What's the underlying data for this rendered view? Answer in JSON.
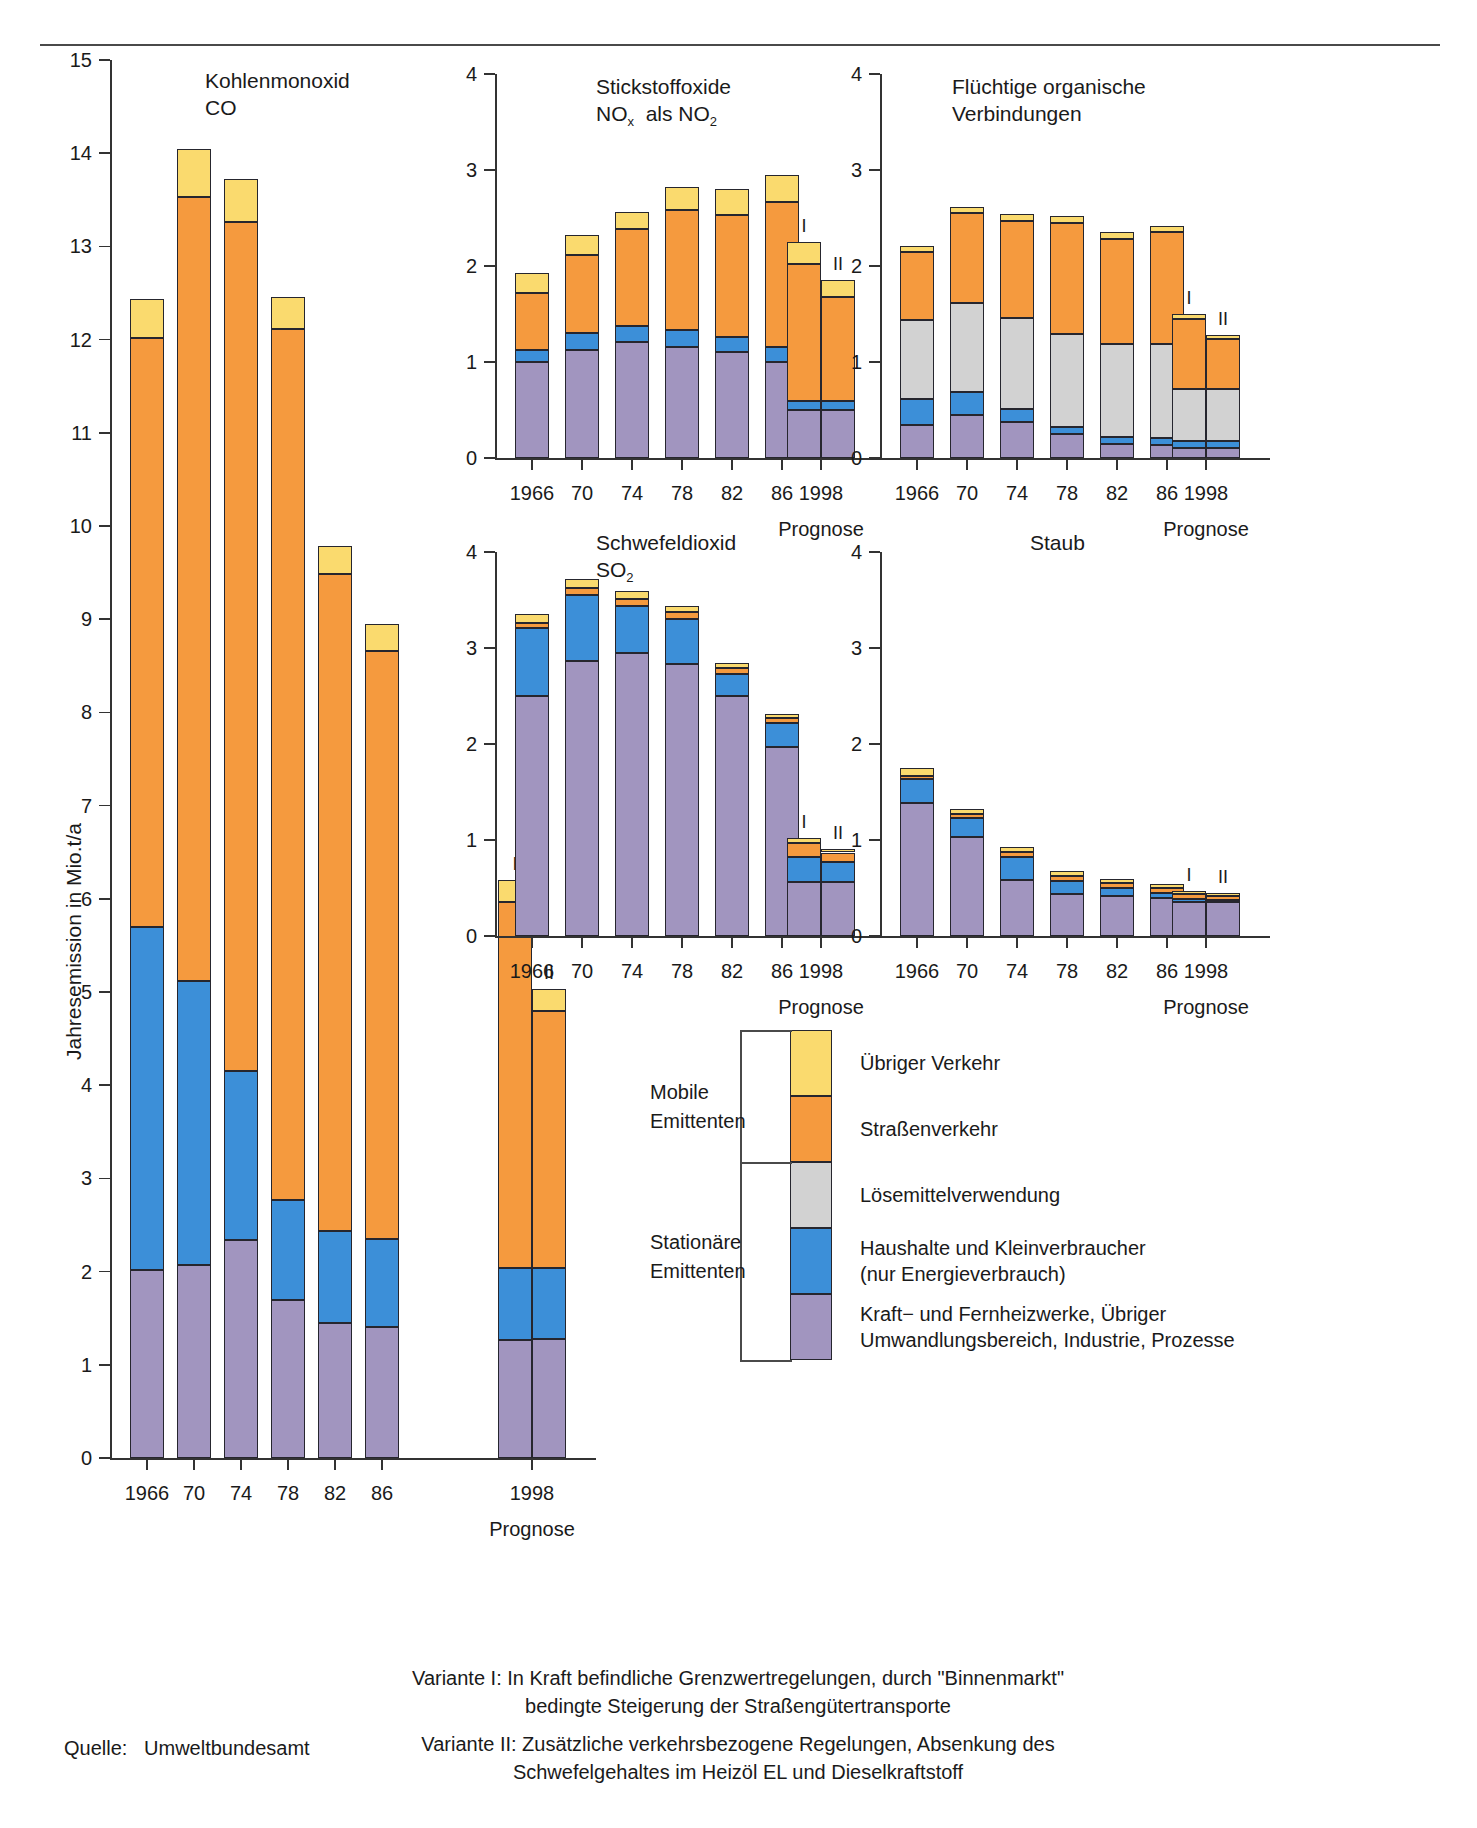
{
  "meta": {
    "y_axis_label": "Jahresemission in Mio.t/a",
    "source_label": "Quelle:",
    "source_value": "Umweltbundesamt",
    "prognose_label": "Prognose",
    "variant_i": "I",
    "variant_ii": "II"
  },
  "legend": {
    "group_mobile": "Mobile\nEmittenten",
    "group_mobile_l1": "Mobile",
    "group_mobile_l2": "Emittenten",
    "group_stationary_l1": "Stationäre",
    "group_stationary_l2": "Emittenten",
    "items": [
      {
        "key": "uebriger_verkehr",
        "label": "Übriger Verkehr",
        "color": "#fada6e"
      },
      {
        "key": "strassenverkehr",
        "label": "Straßenverkehr",
        "color": "#f59a3e"
      },
      {
        "key": "loesemittel",
        "label": "Lösemittelverwendung",
        "color": "#d2d2d2"
      },
      {
        "key": "haushalte",
        "label": "Haushalte und Kleinverbraucher",
        "label2": "(nur Energieverbrauch)",
        "color": "#3c8fd8"
      },
      {
        "key": "kraftwerke",
        "label": "Kraft− und Fernheizwerke, Übriger",
        "label2": "Umwandlungsbereich, Industrie, Prozesse",
        "color": "#a195bf"
      }
    ]
  },
  "footnotes": [
    {
      "line1": "Variante I: In Kraft befindliche Grenzwertregelungen, durch \"Binnenmarkt\"",
      "line2": "bedingte Steigerung der Straßengütertransporte"
    },
    {
      "line1": "Variante II: Zusätzliche verkehrsbezogene Regelungen, Absenkung des",
      "line2": "Schwefelgehaltes im Heizöl EL und Dieselkraftstoff"
    }
  ],
  "chart_data": [
    {
      "id": "co",
      "type": "bar",
      "stacked": true,
      "title": "Kohlenmonoxid",
      "subtitle": "CO",
      "ylabel": "Jahresemission in Mio.t/a",
      "ylim": [
        0,
        15
      ],
      "yticks": [
        0,
        1,
        2,
        3,
        4,
        5,
        6,
        7,
        8,
        9,
        10,
        11,
        12,
        13,
        14,
        15
      ],
      "categories": [
        "1966",
        "70",
        "74",
        "78",
        "82",
        "86"
      ],
      "prognose_categories": [
        "I",
        "II"
      ],
      "prognose_xlabel": "1998",
      "series": [
        {
          "name": "Kraft− und Fernheizwerke, Übriger Umwandlungsbereich, Industrie, Prozesse",
          "color": "#a195bf",
          "values": [
            2.02,
            2.07,
            2.34,
            1.7,
            1.45,
            1.41
          ],
          "prognose": [
            1.27,
            1.28
          ]
        },
        {
          "name": "Haushalte und Kleinverbraucher (nur Energieverbrauch)",
          "color": "#3c8fd8",
          "values": [
            3.68,
            3.05,
            1.81,
            1.07,
            0.99,
            0.94
          ],
          "prognose": [
            0.77,
            0.76
          ]
        },
        {
          "name": "Straßenverkehr",
          "color": "#f59a3e",
          "values": [
            6.32,
            8.41,
            9.11,
            9.34,
            7.05,
            6.31
          ],
          "prognose": [
            3.93,
            2.76
          ]
        },
        {
          "name": "Übriger Verkehr",
          "color": "#fada6e",
          "values": [
            0.42,
            0.52,
            0.46,
            0.35,
            0.3,
            0.29
          ],
          "prognose": [
            0.23,
            0.23
          ]
        }
      ],
      "totals": [
        12.44,
        14.05,
        13.72,
        12.46,
        9.79,
        8.95
      ],
      "prognose_totals": [
        6.2,
        5.03
      ]
    },
    {
      "id": "nox",
      "type": "bar",
      "stacked": true,
      "title": "Stickstoffoxide",
      "subtitle": "NOx  als NO2",
      "ylim": [
        0,
        4
      ],
      "yticks": [
        0,
        1,
        2,
        3,
        4
      ],
      "categories": [
        "1966",
        "70",
        "74",
        "78",
        "82",
        "86"
      ],
      "prognose_categories": [
        "I",
        "II"
      ],
      "prognose_xlabel": "1998",
      "series": [
        {
          "name": "Kraft− und Fernheizwerke, Übriger Umwandlungsbereich, Industrie, Prozesse",
          "color": "#a195bf",
          "values": [
            1.0,
            1.12,
            1.21,
            1.16,
            1.1,
            1.0
          ],
          "prognose": [
            0.5,
            0.5
          ]
        },
        {
          "name": "Haushalte und Kleinverbraucher (nur Energieverbrauch)",
          "color": "#3c8fd8",
          "values": [
            0.12,
            0.18,
            0.17,
            0.17,
            0.16,
            0.16
          ],
          "prognose": [
            0.09,
            0.09
          ]
        },
        {
          "name": "Straßenverkehr",
          "color": "#f59a3e",
          "values": [
            0.6,
            0.81,
            1.01,
            1.25,
            1.27,
            1.51
          ],
          "prognose": [
            1.43,
            1.09
          ]
        },
        {
          "name": "Übriger Verkehr",
          "color": "#fada6e",
          "values": [
            0.21,
            0.21,
            0.17,
            0.24,
            0.27,
            0.28
          ],
          "prognose": [
            0.23,
            0.17
          ]
        }
      ],
      "totals": [
        1.93,
        2.32,
        2.56,
        2.82,
        2.8,
        2.95
      ],
      "prognose_totals": [
        2.25,
        1.85
      ]
    },
    {
      "id": "voc",
      "type": "bar",
      "stacked": true,
      "title": "Flüchtige organische",
      "subtitle": "Verbindungen",
      "ylim": [
        0,
        4
      ],
      "yticks": [
        0,
        1,
        2,
        3,
        4
      ],
      "categories": [
        "1966",
        "70",
        "74",
        "78",
        "82",
        "86"
      ],
      "prognose_categories": [
        "I",
        "II"
      ],
      "prognose_xlabel": "1998",
      "series": [
        {
          "name": "Kraft− und Fernheizwerke, Übriger Umwandlungsbereich, Industrie, Prozesse",
          "color": "#a195bf",
          "values": [
            0.34,
            0.45,
            0.38,
            0.25,
            0.15,
            0.14
          ],
          "prognose": [
            0.1,
            0.1
          ]
        },
        {
          "name": "Haushalte und Kleinverbraucher (nur Energieverbrauch)",
          "color": "#3c8fd8",
          "values": [
            0.27,
            0.24,
            0.13,
            0.07,
            0.07,
            0.07
          ],
          "prognose": [
            0.08,
            0.08
          ]
        },
        {
          "name": "Lösemittelverwendung",
          "color": "#d2d2d2",
          "values": [
            0.83,
            0.92,
            0.95,
            0.97,
            0.97,
            0.98
          ],
          "prognose": [
            0.54,
            0.54
          ]
        },
        {
          "name": "Straßenverkehr",
          "color": "#f59a3e",
          "values": [
            0.71,
            0.94,
            1.01,
            1.16,
            1.09,
            1.16
          ],
          "prognose": [
            0.73,
            0.52
          ]
        },
        {
          "name": "Übriger Verkehr",
          "color": "#fada6e",
          "values": [
            0.06,
            0.06,
            0.07,
            0.07,
            0.07,
            0.07
          ],
          "prognose": [
            0.05,
            0.04
          ]
        }
      ],
      "totals": [
        2.21,
        2.61,
        2.54,
        2.52,
        2.35,
        2.42
      ],
      "prognose_totals": [
        1.5,
        1.28
      ]
    },
    {
      "id": "so2",
      "type": "bar",
      "stacked": true,
      "title": "Schwefeldioxid",
      "subtitle": "SO2",
      "ylim": [
        0,
        4
      ],
      "yticks": [
        0,
        1,
        2,
        3,
        4
      ],
      "categories": [
        "1966",
        "70",
        "74",
        "78",
        "82",
        "86"
      ],
      "prognose_categories": [
        "I",
        "II"
      ],
      "prognose_xlabel": "1998",
      "series": [
        {
          "name": "Kraft− und Fernheizwerke, Übriger Umwandlungsbereich, Industrie, Prozesse",
          "color": "#a195bf",
          "values": [
            2.5,
            2.86,
            2.95,
            2.83,
            2.5,
            1.97
          ],
          "prognose": [
            0.56,
            0.56
          ]
        },
        {
          "name": "Haushalte und Kleinverbraucher (nur Energieverbrauch)",
          "color": "#3c8fd8",
          "values": [
            0.71,
            0.69,
            0.49,
            0.47,
            0.23,
            0.25
          ],
          "prognose": [
            0.26,
            0.21
          ]
        },
        {
          "name": "Straßenverkehr",
          "color": "#f59a3e",
          "values": [
            0.05,
            0.07,
            0.07,
            0.07,
            0.06,
            0.05
          ],
          "prognose": [
            0.15,
            0.1
          ]
        },
        {
          "name": "Übriger Verkehr",
          "color": "#fada6e",
          "values": [
            0.09,
            0.1,
            0.08,
            0.07,
            0.05,
            0.04
          ],
          "prognose": [
            0.05,
            0.04
          ]
        }
      ],
      "totals": [
        3.35,
        3.72,
        3.59,
        3.44,
        2.84,
        2.31
      ],
      "prognose_totals": [
        1.02,
        0.91
      ]
    },
    {
      "id": "staub",
      "type": "bar",
      "stacked": true,
      "title": "Staub",
      "subtitle": "",
      "ylim": [
        0,
        4
      ],
      "yticks": [
        0,
        1,
        2,
        3,
        4
      ],
      "categories": [
        "1966",
        "70",
        "74",
        "78",
        "82",
        "86"
      ],
      "prognose_categories": [
        "I",
        "II"
      ],
      "prognose_xlabel": "1998",
      "series": [
        {
          "name": "Kraft− und Fernheizwerke, Übriger Umwandlungsbereich, Industrie, Prozesse",
          "color": "#a195bf",
          "values": [
            1.39,
            1.03,
            0.58,
            0.44,
            0.42,
            0.4
          ],
          "prognose": [
            0.35,
            0.35
          ]
        },
        {
          "name": "Haushalte und Kleinverbraucher (nur Energieverbrauch)",
          "color": "#3c8fd8",
          "values": [
            0.25,
            0.2,
            0.24,
            0.13,
            0.08,
            0.05
          ],
          "prognose": [
            0.04,
            0.03
          ]
        },
        {
          "name": "Straßenverkehr",
          "color": "#f59a3e",
          "values": [
            0.03,
            0.04,
            0.05,
            0.06,
            0.05,
            0.05
          ],
          "prognose": [
            0.05,
            0.04
          ]
        },
        {
          "name": "Übriger Verkehr",
          "color": "#fada6e",
          "values": [
            0.08,
            0.05,
            0.06,
            0.05,
            0.04,
            0.04
          ],
          "prognose": [
            0.03,
            0.03
          ]
        }
      ],
      "totals": [
        1.75,
        1.32,
        0.93,
        0.68,
        0.59,
        0.54
      ],
      "prognose_totals": [
        0.47,
        0.45
      ]
    }
  ]
}
